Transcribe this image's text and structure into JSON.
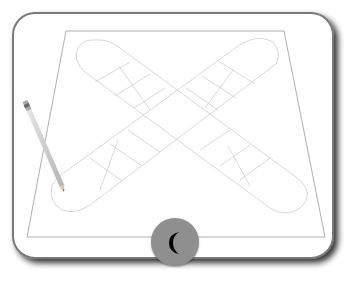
{
  "game": {
    "name": "Cross board game",
    "board": {
      "layout": "cross",
      "arms": 4,
      "cells_per_arm_row": 3,
      "line_color": "#d6d6d6",
      "border_color": "#8a8a8a"
    },
    "pencil": {
      "icon": "pencil-icon"
    },
    "mode_button": {
      "icon": "moon-icon",
      "color": "#8f8f8f",
      "glyph_color": "#000000"
    }
  }
}
